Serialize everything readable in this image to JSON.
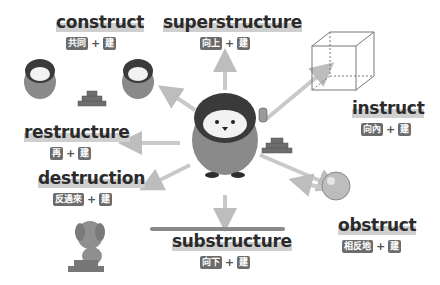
{
  "diagram": {
    "center": "penguin-with-trowel",
    "root_kanji": "建",
    "terms": [
      {
        "id": "construct",
        "word": "construct",
        "parts": [
          "共同",
          "建"
        ]
      },
      {
        "id": "superstructure",
        "word": "superstructure",
        "parts": [
          "向上",
          "建"
        ]
      },
      {
        "id": "instruct",
        "word": "instruct",
        "parts": [
          "向內",
          "建"
        ]
      },
      {
        "id": "restructure",
        "word": "restructure",
        "parts": [
          "再",
          "建"
        ]
      },
      {
        "id": "destruction",
        "word": "destruction",
        "parts": [
          "反過來",
          "建"
        ]
      },
      {
        "id": "substructure",
        "word": "substructure",
        "parts": [
          "向下",
          "建"
        ]
      },
      {
        "id": "obstruct",
        "word": "obstruct",
        "parts": [
          "相反地",
          "建"
        ]
      }
    ],
    "plus": "+"
  },
  "colors": {
    "text": "#2b2b2b",
    "tag": "#6b6b6b",
    "arrow": "#c9c9c9",
    "penguin_body": "#8a8a8a",
    "penguin_head": "#3a3a3a",
    "brick": "#6e6e6e"
  }
}
